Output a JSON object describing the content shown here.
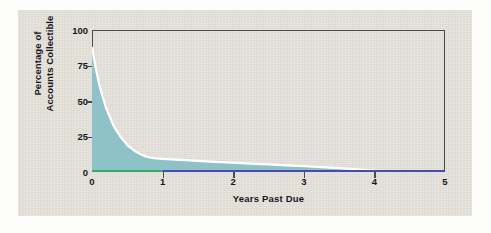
{
  "chart_data": {
    "type": "area",
    "title": "",
    "xlabel": "Years Past Due",
    "ylabel": "Percentage of Accounts Collectible",
    "ylabel_lines": [
      "Percentage of",
      "Accounts Collectible"
    ],
    "xlim": [
      0,
      5
    ],
    "ylim": [
      0,
      100
    ],
    "xticks": [
      0,
      1,
      2,
      3,
      4,
      5
    ],
    "xtick_labels": [
      "0",
      "1",
      "2",
      "3",
      "4",
      "5"
    ],
    "yticks": [
      0,
      25,
      50,
      75,
      100
    ],
    "ytick_labels": [
      "0",
      "25",
      "50",
      "75",
      "100"
    ],
    "grid": false,
    "legend": "none",
    "series": [
      {
        "name": "Percentage of Accounts Collectible",
        "fill_color": "#8fc2c8",
        "line_color": "#ffffff",
        "x": [
          0.0,
          0.05,
          0.1,
          0.15,
          0.2,
          0.25,
          0.3,
          0.35,
          0.4,
          0.45,
          0.5,
          0.55,
          0.6,
          0.65,
          0.7,
          0.75,
          0.8,
          0.9,
          1.0,
          1.25,
          1.5,
          1.75,
          2.0,
          2.25,
          2.5,
          2.75,
          3.0,
          3.25,
          3.5,
          3.75,
          4.0,
          4.15,
          4.3
        ],
        "y": [
          88,
          74,
          62,
          53,
          45,
          39,
          33,
          29,
          25,
          22,
          19,
          17,
          15,
          13.5,
          12.2,
          11.2,
          10.4,
          9.6,
          9.2,
          8.5,
          7.8,
          7.1,
          6.5,
          5.9,
          5.3,
          4.7,
          4.1,
          3.4,
          2.7,
          1.9,
          1.0,
          0.5,
          0.0
        ]
      }
    ],
    "baseline_segments": [
      {
        "name": "baseline-green",
        "color": "#3aa86a",
        "x_start": 0.0,
        "x_end": 1.0
      },
      {
        "name": "baseline-blue",
        "color": "#4a4ab4",
        "x_start": 1.0,
        "x_end": 5.0
      }
    ],
    "colors": {
      "panel_background": "#e4e1da",
      "figure_background": "#fdfdfb",
      "axis": "#4a4a4a",
      "text": "#17171a",
      "area_fill": "#8fc2c8",
      "curve_line": "#ffffff"
    }
  }
}
